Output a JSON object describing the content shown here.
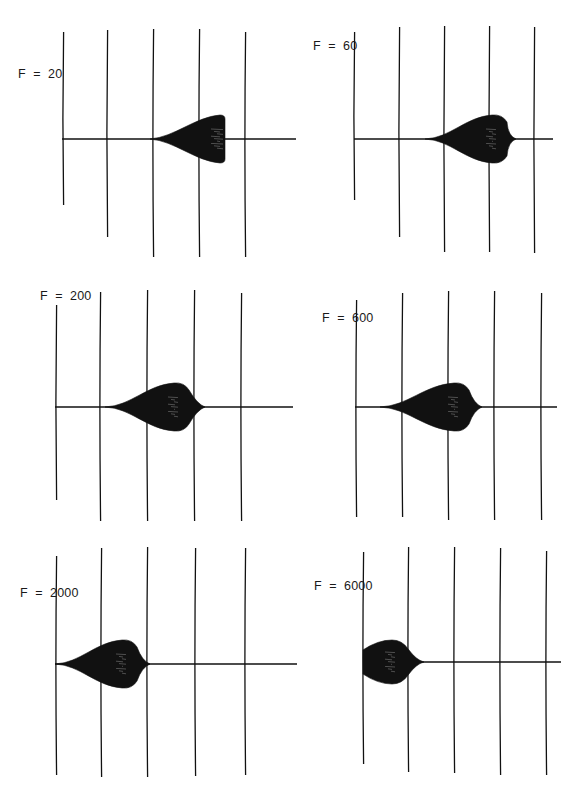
{
  "figure": {
    "background": "#ffffff",
    "ink": "#111111",
    "panels": [
      {
        "label": "F  =  20",
        "F": 20,
        "label_pos": [
          18,
          79
        ],
        "baseline": {
          "y": 139,
          "x1": 62,
          "x2": 296
        },
        "verticals": [
          {
            "x": 63,
            "top": 32,
            "bottom": 205
          },
          {
            "x": 107,
            "top": 30,
            "bottom": 237
          },
          {
            "x": 153,
            "top": 29,
            "bottom": 257
          },
          {
            "x": 199,
            "top": 29,
            "bottom": 257
          },
          {
            "x": 245,
            "top": 32,
            "bottom": 257
          }
        ],
        "envelope": {
          "start": 150,
          "peak_x": 220,
          "end": 225,
          "amp": 24,
          "shape": "growing-cutoff"
        }
      },
      {
        "label": "F  =  60",
        "F": 60,
        "label_pos": [
          313,
          51
        ],
        "baseline": {
          "y": 139,
          "x1": 354,
          "x2": 553
        },
        "verticals": [
          {
            "x": 354,
            "top": 32,
            "bottom": 200
          },
          {
            "x": 399,
            "top": 27,
            "bottom": 237
          },
          {
            "x": 444,
            "top": 26,
            "bottom": 252
          },
          {
            "x": 489,
            "top": 26,
            "bottom": 252
          },
          {
            "x": 534,
            "top": 27,
            "bottom": 253
          }
        ],
        "envelope": {
          "start": 425,
          "peak_x": 498,
          "end": 516,
          "amp": 24,
          "shape": "teardrop"
        }
      },
      {
        "label": "F  =  200",
        "F": 200,
        "label_pos": [
          40,
          301
        ],
        "baseline": {
          "y": 407,
          "x1": 55,
          "x2": 293
        },
        "verticals": [
          {
            "x": 56,
            "top": 305,
            "bottom": 500
          },
          {
            "x": 100,
            "top": 292,
            "bottom": 521
          },
          {
            "x": 147,
            "top": 290,
            "bottom": 521
          },
          {
            "x": 194,
            "top": 290,
            "bottom": 521
          },
          {
            "x": 241,
            "top": 293,
            "bottom": 521
          }
        ],
        "envelope": {
          "start": 105,
          "peak_x": 180,
          "end": 205,
          "amp": 24,
          "shape": "teardrop"
        }
      },
      {
        "label": "F  =  600",
        "F": 600,
        "label_pos": [
          322,
          323
        ],
        "baseline": {
          "y": 407,
          "x1": 355,
          "x2": 557
        },
        "verticals": [
          {
            "x": 356,
            "top": 300,
            "bottom": 517
          },
          {
            "x": 402,
            "top": 293,
            "bottom": 517
          },
          {
            "x": 448,
            "top": 291,
            "bottom": 520
          },
          {
            "x": 494,
            "top": 291,
            "bottom": 520
          },
          {
            "x": 541,
            "top": 293,
            "bottom": 520
          }
        ],
        "envelope": {
          "start": 380,
          "peak_x": 460,
          "end": 482,
          "amp": 24,
          "shape": "teardrop"
        }
      },
      {
        "label": "F  =  2000",
        "F": 2000,
        "label_pos": [
          20,
          598
        ],
        "baseline": {
          "y": 664,
          "x1": 55,
          "x2": 297
        },
        "verticals": [
          {
            "x": 56,
            "top": 556,
            "bottom": 775
          },
          {
            "x": 101,
            "top": 548,
            "bottom": 777
          },
          {
            "x": 147,
            "top": 547,
            "bottom": 777
          },
          {
            "x": 195,
            "top": 548,
            "bottom": 776
          },
          {
            "x": 245,
            "top": 548,
            "bottom": 775
          }
        ],
        "envelope": {
          "start": 55,
          "peak_x": 128,
          "end": 150,
          "amp": 24,
          "shape": "teardrop"
        }
      },
      {
        "label": "F  =  6000",
        "F": 6000,
        "label_pos": [
          314,
          591
        ],
        "baseline": {
          "y": 662,
          "x1": 363,
          "x2": 561
        },
        "verticals": [
          {
            "x": 363,
            "top": 552,
            "bottom": 764
          },
          {
            "x": 408,
            "top": 547,
            "bottom": 772
          },
          {
            "x": 454,
            "top": 547,
            "bottom": 773
          },
          {
            "x": 500,
            "top": 548,
            "bottom": 775
          },
          {
            "x": 546,
            "top": 551,
            "bottom": 775
          }
        ],
        "envelope": {
          "start": 363,
          "peak_x": 400,
          "end": 424,
          "amp": 22,
          "shape": "front-loaded"
        }
      }
    ]
  },
  "chart_data": [
    {
      "type": "line",
      "title": "F = 20",
      "description": "Oscillation amplitude envelope grows along the time axis, abruptly cut off near 4th gridline",
      "envelope_start_gridline": 2.0,
      "envelope_peak_gridline": 3.5,
      "envelope_end_gridline": 3.55,
      "peak_amplitude_px": 24,
      "gridlines": 5,
      "xlabel": "",
      "ylabel": ""
    },
    {
      "type": "line",
      "title": "F = 60",
      "description": "Teardrop envelope peaking just past 4th gridline",
      "envelope_start_gridline": 1.6,
      "envelope_peak_gridline": 3.2,
      "envelope_end_gridline": 3.6,
      "peak_amplitude_px": 24,
      "gridlines": 5
    },
    {
      "type": "line",
      "title": "F = 200",
      "description": "Teardrop envelope peaking between 3rd and 4th gridline",
      "envelope_start_gridline": 1.1,
      "envelope_peak_gridline": 2.7,
      "envelope_end_gridline": 3.2,
      "peak_amplitude_px": 24,
      "gridlines": 5
    },
    {
      "type": "line",
      "title": "F = 600",
      "description": "Teardrop envelope peaking just past 3rd gridline",
      "envelope_start_gridline": 0.5,
      "envelope_peak_gridline": 2.25,
      "envelope_end_gridline": 2.7,
      "peak_amplitude_px": 24,
      "gridlines": 5
    },
    {
      "type": "line",
      "title": "F = 2000",
      "description": "Teardrop envelope peaking between 2nd and 3rd gridline, starting at origin",
      "envelope_start_gridline": 0.0,
      "envelope_peak_gridline": 1.6,
      "envelope_end_gridline": 2.05,
      "peak_amplitude_px": 24,
      "gridlines": 5
    },
    {
      "type": "line",
      "title": "F = 6000",
      "description": "Envelope starts at maximum at origin, decays by ~1.3 gridlines",
      "envelope_start_gridline": 0.0,
      "envelope_peak_gridline": 0.8,
      "envelope_end_gridline": 1.3,
      "peak_amplitude_px": 22,
      "gridlines": 5
    }
  ]
}
